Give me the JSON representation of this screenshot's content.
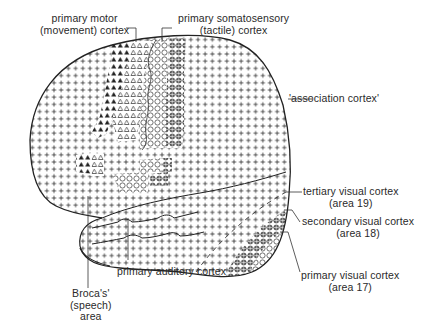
{
  "figure": {
    "colors": {
      "ink": "#2a2a2a",
      "background": "#ffffff"
    },
    "legend_symbols": {
      "association_cortex": "plus",
      "primary_motor_cortex": "filled-triangle",
      "premotor_region": "open-triangle",
      "primary_somatosensory_cortex": "open-circle",
      "secondary_somatosensory_region": "circle-cross",
      "primary_visual_cortex": "open-circle",
      "secondary_visual_cortex": "circle-cross",
      "tertiary_visual_cortex": "plus-dashed"
    }
  },
  "labels": {
    "motor": {
      "line1": "primary motor",
      "line2": "(movement) cortex"
    },
    "somatosensory": {
      "line1": "primary somatosensory",
      "line2": "(tactile) cortex"
    },
    "association": {
      "line1": "'association cortex'"
    },
    "tertiary_visual": {
      "line1": "tertiary visual cortex",
      "line2": "(area 19)"
    },
    "secondary_visual": {
      "line1": "secondary visual cortex",
      "line2": "(area 18)"
    },
    "primary_visual": {
      "line1": "primary visual cortex",
      "line2": "(area 17)"
    },
    "auditory": {
      "line1": "primary auditory cortex"
    },
    "broca": {
      "line1": "Broca's'",
      "line2": "(speech)",
      "line3": "area"
    }
  }
}
